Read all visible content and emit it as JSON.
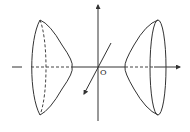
{
  "diagram": {
    "type": "hyperboloid-of-two-sheets",
    "origin_label": "O",
    "colors": {
      "stroke": "#333333",
      "background": "#ffffff"
    },
    "axes": [
      "x-axis (horizontal, arrow right)",
      "z-axis (vertical, arrow up)",
      "y-axis (diagonal, arrow lower-left)"
    ],
    "sheets": [
      "left-sheet",
      "right-sheet"
    ]
  }
}
